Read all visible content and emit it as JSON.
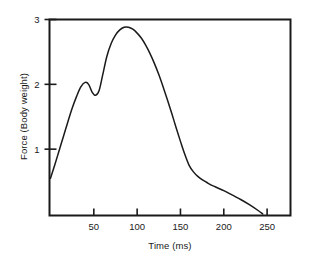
{
  "chart_data": {
    "type": "line",
    "title": "",
    "subtitle": "",
    "xlabel": "Time (ms)",
    "ylabel": "Force (Body weight)",
    "xlim": [
      0,
      277
    ],
    "ylim": [
      0,
      3
    ],
    "xticks": [
      50,
      100,
      150,
      200,
      250
    ],
    "xtick_labels": [
      "50",
      "100",
      "150",
      "200",
      "250"
    ],
    "yticks": [
      1,
      2,
      3
    ],
    "ytick_labels": [
      "1",
      "2",
      "3"
    ],
    "grid": false,
    "legend": false,
    "legend_position": "none",
    "annotations": [],
    "series": [
      {
        "name": "Vertical ground reaction force",
        "color": "#1a1a1a",
        "x": [
          0,
          5,
          10,
          15,
          20,
          25,
          30,
          35,
          40,
          44,
          48,
          52,
          56,
          60,
          65,
          70,
          75,
          80,
          85,
          90,
          95,
          100,
          105,
          110,
          115,
          120,
          125,
          130,
          135,
          140,
          145,
          150,
          155,
          160,
          165,
          170,
          175,
          180,
          185,
          190,
          195,
          200,
          210,
          220,
          230,
          240,
          245
        ],
        "y": [
          0.55,
          0.76,
          0.98,
          1.2,
          1.42,
          1.63,
          1.81,
          1.96,
          2.03,
          2.0,
          1.88,
          1.83,
          1.9,
          2.13,
          2.43,
          2.63,
          2.76,
          2.84,
          2.88,
          2.88,
          2.85,
          2.79,
          2.71,
          2.6,
          2.47,
          2.32,
          2.15,
          1.96,
          1.76,
          1.55,
          1.33,
          1.12,
          0.92,
          0.75,
          0.65,
          0.58,
          0.53,
          0.49,
          0.45,
          0.42,
          0.39,
          0.36,
          0.29,
          0.22,
          0.14,
          0.05,
          0.0
        ]
      }
    ],
    "frame": {
      "top": true,
      "right": true,
      "bottom": true,
      "left": true
    }
  },
  "axes": {
    "x_title": "Time (ms)",
    "y_title": "Force (Body weight)"
  }
}
